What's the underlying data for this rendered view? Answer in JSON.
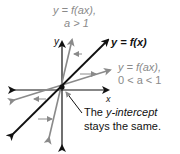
{
  "diagram": {
    "axes": {
      "x_label": "x",
      "y_label": "y"
    },
    "curves": [
      {
        "name": "f(x)",
        "label": "y = f(x)",
        "color": "#111111"
      },
      {
        "name": "f(ax) steep",
        "label_line1": "y = f(ax),",
        "label_line2": "a > 1",
        "color": "#8a8a8a"
      },
      {
        "name": "f(ax) shallow",
        "label_line1": "y = f(ax),",
        "label_line2": "0 < a < 1",
        "color": "#8a8a8a"
      }
    ],
    "annotation": {
      "line1_prefix": "The ",
      "line1_italic": "y-intercept",
      "line2": "stays the same."
    },
    "colors": {
      "black": "#111111",
      "gray": "#8a8a8a"
    }
  }
}
